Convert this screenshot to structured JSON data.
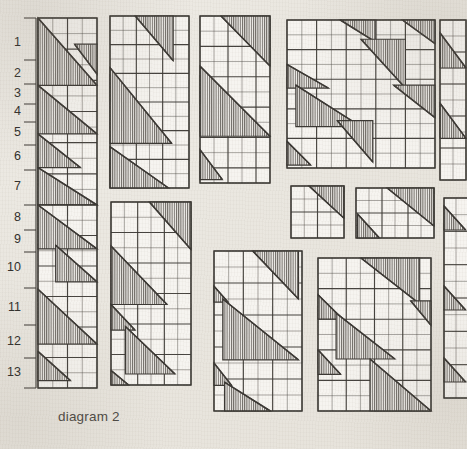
{
  "figure": {
    "caption": "diagram 2",
    "background_color": "#eae7e0",
    "ink_color": "#3a3733",
    "hatch_color": "#55514c"
  },
  "row_ruler": {
    "name": "row-number-ruler",
    "axis_x": 36,
    "axis_top": 18,
    "axis_bottom": 388,
    "labels": [
      {
        "n": "1",
        "y": 43
      },
      {
        "n": "2",
        "y": 74
      },
      {
        "n": "3",
        "y": 94
      },
      {
        "n": "4",
        "y": 112
      },
      {
        "n": "5",
        "y": 133
      },
      {
        "n": "6",
        "y": 157
      },
      {
        "n": "7",
        "y": 187
      },
      {
        "n": "8",
        "y": 218
      },
      {
        "n": "9",
        "y": 240
      },
      {
        "n": "10",
        "y": 268
      },
      {
        "n": "11",
        "y": 308
      },
      {
        "n": "12",
        "y": 342
      },
      {
        "n": "13",
        "y": 373
      }
    ],
    "ticks": [
      18,
      60,
      84,
      104,
      122,
      145,
      170,
      205,
      230,
      252,
      288,
      325,
      358,
      388
    ]
  },
  "chart_data": {
    "type": "diagram",
    "title": "diagram 2",
    "blocks": [
      {
        "id": "block-1",
        "name": "block-strip-left-upper",
        "x": 38,
        "y": 18,
        "w": 59,
        "h": 187,
        "cols": 4,
        "rows": 12,
        "triangles": [
          {
            "x0": 0,
            "y0": 0,
            "x1": 1,
            "y1": 0.36,
            "dir": "ul"
          },
          {
            "x0": 0.62,
            "y0": 0.14,
            "x1": 1,
            "y1": 0.3,
            "dir": "ur"
          },
          {
            "x0": 0,
            "y0": 0.36,
            "x1": 1,
            "y1": 0.62,
            "dir": "ul"
          },
          {
            "x0": 0,
            "y0": 0.62,
            "x1": 0.72,
            "y1": 0.8,
            "dir": "ul"
          },
          {
            "x0": 0,
            "y0": 0.8,
            "x1": 1,
            "y1": 1.0,
            "dir": "ul"
          }
        ]
      },
      {
        "id": "block-2",
        "name": "block-strip-left-lower",
        "x": 38,
        "y": 205,
        "w": 59,
        "h": 183,
        "cols": 4,
        "rows": 12,
        "triangles": [
          {
            "x0": 0,
            "y0": 0,
            "x1": 1,
            "y1": 0.24,
            "dir": "ul"
          },
          {
            "x0": 0.3,
            "y0": 0.22,
            "x1": 1,
            "y1": 0.42,
            "dir": "ul"
          },
          {
            "x0": 0,
            "y0": 0.46,
            "x1": 1,
            "y1": 0.76,
            "dir": "ul"
          },
          {
            "x0": 0,
            "y0": 0.8,
            "x1": 0.55,
            "y1": 0.96,
            "dir": "ul"
          }
        ]
      },
      {
        "id": "block-3",
        "name": "block-tall-column-2",
        "x": 110,
        "y": 16,
        "w": 79,
        "h": 172,
        "cols": 6,
        "rows": 12,
        "triangles": [
          {
            "x0": 0.32,
            "y0": 0.0,
            "x1": 0.8,
            "y1": 0.26,
            "dir": "ur"
          },
          {
            "x0": 0,
            "y0": 0.3,
            "x1": 0.78,
            "y1": 0.74,
            "dir": "ul"
          },
          {
            "x0": 0,
            "y0": 0.76,
            "x1": 0.74,
            "y1": 1.0,
            "dir": "ul"
          }
        ]
      },
      {
        "id": "block-4",
        "name": "block-tall-column-3",
        "x": 200,
        "y": 16,
        "w": 70,
        "h": 167,
        "cols": 5,
        "rows": 11,
        "triangles": [
          {
            "x0": 0.3,
            "y0": 0.0,
            "x1": 1.0,
            "y1": 0.3,
            "dir": "ur"
          },
          {
            "x0": 0,
            "y0": 0.3,
            "x1": 1.0,
            "y1": 0.72,
            "dir": "ul"
          },
          {
            "x0": 0,
            "y0": 0.8,
            "x1": 0.32,
            "y1": 0.98,
            "dir": "ul"
          }
        ]
      },
      {
        "id": "block-5",
        "name": "block-large-square",
        "x": 287,
        "y": 20,
        "w": 148,
        "h": 148,
        "cols": 10,
        "rows": 10,
        "triangles": [
          {
            "x0": 0.36,
            "y0": 0.0,
            "x1": 0.6,
            "y1": 0.15,
            "dir": "ur"
          },
          {
            "x0": 0.78,
            "y0": 0.0,
            "x1": 1.0,
            "y1": 0.16,
            "dir": "ur"
          },
          {
            "x0": 0.5,
            "y0": 0.13,
            "x1": 0.8,
            "y1": 0.46,
            "dir": "ur"
          },
          {
            "x0": 0,
            "y0": 0.3,
            "x1": 0.28,
            "y1": 0.46,
            "dir": "ul"
          },
          {
            "x0": 0.06,
            "y0": 0.44,
            "x1": 0.5,
            "y1": 0.72,
            "dir": "ul"
          },
          {
            "x0": 0.72,
            "y0": 0.44,
            "x1": 1.0,
            "y1": 0.66,
            "dir": "ur"
          },
          {
            "x0": 0.34,
            "y0": 0.68,
            "x1": 0.58,
            "y1": 0.96,
            "dir": "ur"
          },
          {
            "x0": 0,
            "y0": 0.82,
            "x1": 0.16,
            "y1": 0.98,
            "dir": "ul"
          }
        ]
      },
      {
        "id": "block-6",
        "name": "block-small-mid-left",
        "x": 291,
        "y": 186,
        "w": 53,
        "h": 52,
        "cols": 4,
        "rows": 4,
        "triangles": [
          {
            "x0": 0.34,
            "y0": 0.0,
            "x1": 1.0,
            "y1": 0.62,
            "dir": "ur"
          }
        ]
      },
      {
        "id": "block-7",
        "name": "block-small-mid-right",
        "x": 356,
        "y": 188,
        "w": 78,
        "h": 50,
        "cols": 6,
        "rows": 4,
        "triangles": [
          {
            "x0": 0.4,
            "y0": 0.0,
            "x1": 1.0,
            "y1": 0.76,
            "dir": "ur"
          },
          {
            "x0": 0.02,
            "y0": 0.52,
            "x1": 0.3,
            "y1": 1.0,
            "dir": "ul"
          }
        ]
      },
      {
        "id": "block-8",
        "name": "block-tall-column-bottom-left",
        "x": 111,
        "y": 202,
        "w": 80,
        "h": 183,
        "cols": 6,
        "rows": 12,
        "triangles": [
          {
            "x0": 0.48,
            "y0": 0.0,
            "x1": 1.0,
            "y1": 0.26,
            "dir": "ur"
          },
          {
            "x0": 0,
            "y0": 0.24,
            "x1": 0.7,
            "y1": 0.56,
            "dir": "ul"
          },
          {
            "x0": 0,
            "y0": 0.56,
            "x1": 0.3,
            "y1": 0.7,
            "dir": "ul"
          },
          {
            "x0": 0.18,
            "y0": 0.68,
            "x1": 0.8,
            "y1": 0.94,
            "dir": "ul"
          },
          {
            "x0": 0,
            "y0": 0.92,
            "x1": 0.22,
            "y1": 1.0,
            "dir": "ul"
          }
        ]
      },
      {
        "id": "block-9",
        "name": "block-bottom-middle",
        "x": 214,
        "y": 251,
        "w": 88,
        "h": 160,
        "cols": 6,
        "rows": 10,
        "triangles": [
          {
            "x0": 0.44,
            "y0": 0.0,
            "x1": 0.96,
            "y1": 0.3,
            "dir": "ur"
          },
          {
            "x0": 0,
            "y0": 0.22,
            "x1": 0.16,
            "y1": 0.32,
            "dir": "ul"
          },
          {
            "x0": 0.1,
            "y0": 0.3,
            "x1": 0.96,
            "y1": 0.68,
            "dir": "ul"
          },
          {
            "x0": 0,
            "y0": 0.7,
            "x1": 0.2,
            "y1": 0.84,
            "dir": "ul"
          },
          {
            "x0": 0.12,
            "y0": 0.82,
            "x1": 0.64,
            "y1": 1.0,
            "dir": "ul"
          }
        ]
      },
      {
        "id": "block-10",
        "name": "block-bottom-right",
        "x": 318,
        "y": 258,
        "w": 113,
        "h": 153,
        "cols": 8,
        "rows": 10,
        "triangles": [
          {
            "x0": 0.38,
            "y0": 0.0,
            "x1": 0.9,
            "y1": 0.3,
            "dir": "ur"
          },
          {
            "x0": 0,
            "y0": 0.24,
            "x1": 0.22,
            "y1": 0.4,
            "dir": "ul"
          },
          {
            "x0": 0.16,
            "y0": 0.36,
            "x1": 0.68,
            "y1": 0.66,
            "dir": "ul"
          },
          {
            "x0": 0.82,
            "y0": 0.28,
            "x1": 1.0,
            "y1": 0.44,
            "dir": "ur"
          },
          {
            "x0": 0,
            "y0": 0.6,
            "x1": 0.2,
            "y1": 0.76,
            "dir": "ul"
          },
          {
            "x0": 0.46,
            "y0": 0.66,
            "x1": 1.0,
            "y1": 1.0,
            "dir": "ul"
          }
        ]
      },
      {
        "id": "block-11",
        "name": "block-right-edge-upper",
        "x": 440,
        "y": 20,
        "w": 26,
        "h": 160,
        "cols": 2,
        "rows": 10,
        "triangles": [
          {
            "x0": 0,
            "y0": 0.08,
            "x1": 1.0,
            "y1": 0.3,
            "dir": "ul"
          },
          {
            "x0": 0,
            "y0": 0.52,
            "x1": 1.0,
            "y1": 0.74,
            "dir": "ul"
          }
        ]
      },
      {
        "id": "block-12",
        "name": "block-right-edge-lower",
        "x": 444,
        "y": 198,
        "w": 24,
        "h": 200,
        "cols": 2,
        "rows": 12,
        "triangles": [
          {
            "x0": 0,
            "y0": 0.04,
            "x1": 0.9,
            "y1": 0.16,
            "dir": "ul"
          },
          {
            "x0": 0,
            "y0": 0.44,
            "x1": 0.9,
            "y1": 0.56,
            "dir": "ul"
          },
          {
            "x0": 0,
            "y0": 0.8,
            "x1": 0.9,
            "y1": 0.92,
            "dir": "ul"
          }
        ]
      }
    ]
  }
}
